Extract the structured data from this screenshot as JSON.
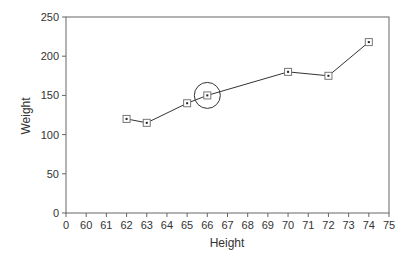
{
  "chart_data": {
    "type": "line",
    "title": "",
    "xlabel": "Height",
    "ylabel": "Weight",
    "x_tick_labels": [
      "0",
      "60",
      "61",
      "62",
      "63",
      "64",
      "65",
      "66",
      "67",
      "68",
      "69",
      "70",
      "71",
      "72",
      "73",
      "74",
      "75"
    ],
    "y_tick_labels": [
      "0",
      "50",
      "100",
      "150",
      "200",
      "250"
    ],
    "ylim": [
      0,
      250
    ],
    "grid": false,
    "legend": null,
    "series": [
      {
        "name": "Weight vs Height",
        "marker": "square",
        "x": [
          62,
          63,
          65,
          66,
          70,
          72,
          74
        ],
        "y": [
          120,
          115,
          140,
          150,
          180,
          175,
          218
        ]
      }
    ],
    "annotations": [
      {
        "type": "circle",
        "x": 66,
        "y": 150,
        "note": "highlighted point"
      }
    ]
  }
}
